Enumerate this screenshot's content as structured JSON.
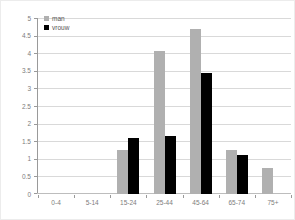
{
  "chart_data": {
    "type": "bar",
    "title": "",
    "categories": [
      "0-4",
      "5-14",
      "15-24",
      "25-44",
      "45-64",
      "65-74",
      "75+"
    ],
    "series": [
      {
        "name": "man",
        "color": "#b0b0b0",
        "values": [
          0,
          0,
          1.25,
          4.05,
          4.7,
          1.25,
          0.75
        ]
      },
      {
        "name": "vrouw",
        "color": "#000000",
        "values": [
          0,
          0,
          1.6,
          1.65,
          3.45,
          1.1,
          0
        ]
      }
    ],
    "ylim": [
      0,
      5
    ],
    "ytick_step": 0.5,
    "ytick_labels": [
      "0",
      "0.5",
      "1",
      "1.5",
      "2",
      "2.5",
      "3",
      "3.5",
      "4",
      "4.5",
      "5"
    ],
    "grid": true,
    "legend_position": "top-left"
  },
  "colors": {
    "background": "#ffffff",
    "gridline": "#d9d9d9",
    "axis": "#9a9a9a",
    "tick_text": "#7d7d7d"
  }
}
